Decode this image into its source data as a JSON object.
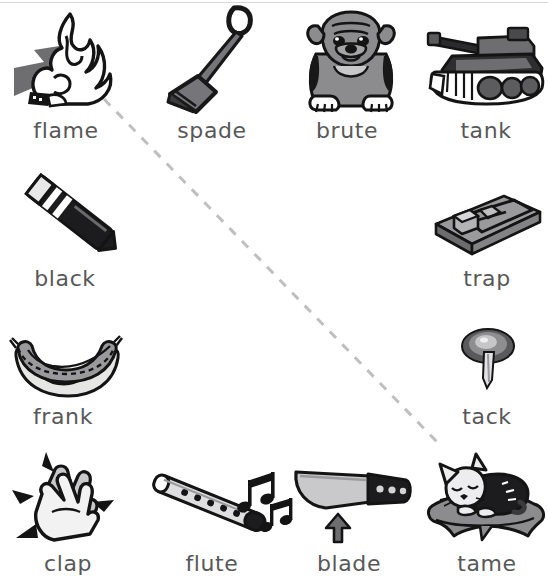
{
  "sheet": {
    "width": 548,
    "height": 582,
    "background": "#ffffff",
    "label_color": "#58585a",
    "ink_color": "#1a1a1a",
    "mid_gray": "#8a8a8a",
    "light_gray": "#d9d9d9",
    "dark_gray": "#4a4a4a",
    "dash_color": "#bfbfbf"
  },
  "annotation": {
    "name": "diagonal-dashed-line",
    "description": "grey dashed line drawn from the flame picture down to the right toward the tack picture",
    "start": {
      "x": 104,
      "y": 99
    },
    "end": {
      "x": 441,
      "y": 446
    },
    "color": "#bfbfbf",
    "dash": "9 9",
    "width": 3
  },
  "items": [
    {
      "id": "flame",
      "label": "flame",
      "icon": "flame-icon",
      "row": 1,
      "col": 1,
      "label_x": 66,
      "label_y": 118,
      "has_arrow": true,
      "arrow_direction": "up-right"
    },
    {
      "id": "spade",
      "label": "spade",
      "icon": "spade-shovel-icon",
      "row": 1,
      "col": 2,
      "label_x": 212,
      "label_y": 118,
      "has_arrow": false
    },
    {
      "id": "brute",
      "label": "brute",
      "icon": "bulldog-icon",
      "row": 1,
      "col": 3,
      "label_x": 347,
      "label_y": 118,
      "has_arrow": false
    },
    {
      "id": "tank",
      "label": "tank",
      "icon": "tank-icon",
      "row": 1,
      "col": 4,
      "label_x": 486,
      "label_y": 118,
      "has_arrow": false
    },
    {
      "id": "black",
      "label": "black",
      "icon": "crayon-icon",
      "row": 2,
      "col": 1,
      "label_x": 65,
      "label_y": 266,
      "has_arrow": false
    },
    {
      "id": "trap",
      "label": "trap",
      "icon": "mousetrap-icon",
      "row": 2,
      "col": 4,
      "label_x": 487,
      "label_y": 266,
      "has_arrow": false
    },
    {
      "id": "frank",
      "label": "frank",
      "icon": "hotdog-icon",
      "row": 3,
      "col": 1,
      "label_x": 63,
      "label_y": 404,
      "has_arrow": false
    },
    {
      "id": "tack",
      "label": "tack",
      "icon": "thumbtack-icon",
      "row": 3,
      "col": 4,
      "label_x": 487,
      "label_y": 404,
      "has_arrow": false
    },
    {
      "id": "clap",
      "label": "clap",
      "icon": "clapping-hands-icon",
      "row": 4,
      "col": 1,
      "label_x": 68,
      "label_y": 551,
      "has_arrow": false
    },
    {
      "id": "flute",
      "label": "flute",
      "icon": "flute-icon",
      "row": 4,
      "col": 2,
      "label_x": 212,
      "label_y": 551,
      "has_arrow": false
    },
    {
      "id": "blade",
      "label": "blade",
      "icon": "knife-blade-icon",
      "row": 4,
      "col": 3,
      "label_x": 349,
      "label_y": 551,
      "has_arrow": true,
      "arrow_direction": "up"
    },
    {
      "id": "tame",
      "label": "tame",
      "icon": "cat-on-pillow-icon",
      "row": 4,
      "col": 4,
      "label_x": 487,
      "label_y": 551,
      "has_arrow": false
    }
  ]
}
